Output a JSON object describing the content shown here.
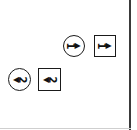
{
  "diagram": {
    "symbols": [
      {
        "id": "circle-1",
        "shape": "circle",
        "label": "1",
        "arrow": "right",
        "arrow_glyph": "▶"
      },
      {
        "id": "box-1",
        "shape": "square",
        "label": "1",
        "arrow": "right",
        "arrow_glyph": "▶"
      },
      {
        "id": "circle-2",
        "shape": "circle",
        "label": "2",
        "arrow": "left",
        "arrow_glyph": "◀"
      },
      {
        "id": "box-2",
        "shape": "square",
        "label": "2",
        "arrow": "left",
        "arrow_glyph": "◀"
      }
    ],
    "colors": {
      "line": "#1a1a1a",
      "background": "#ffffff",
      "frame": "#3a3a3a"
    }
  }
}
